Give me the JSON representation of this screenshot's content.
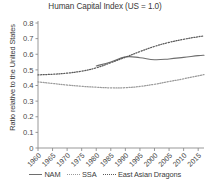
{
  "chart_data": {
    "type": "line",
    "title": "Human Capital Index (US = 1.0)",
    "xlabel": "",
    "ylabel": "Ratio relative to the United States",
    "xlim": [
      1960,
      2017
    ],
    "ylim": [
      0,
      0.8
    ],
    "grid": false,
    "legend_position": "bottom",
    "yticks": [
      "0",
      "0.1",
      "0.2",
      "0.3",
      "0.4",
      "0.5",
      "0.6",
      "0.7",
      "0.8"
    ],
    "ytick_values": [
      0,
      0.1,
      0.2,
      0.3,
      0.4,
      0.5,
      0.6,
      0.7,
      0.8
    ],
    "xticks": [
      "1960",
      "1965",
      "1970",
      "1975",
      "1980",
      "1985",
      "1990",
      "1995",
      "2000",
      "2005",
      "2010",
      "2015"
    ],
    "xtick_values": [
      1960,
      1965,
      1970,
      1975,
      1980,
      1985,
      1990,
      1995,
      2000,
      2005,
      2010,
      2015
    ],
    "series": [
      {
        "name": "NAM",
        "style": "solid",
        "color": "#6e6e6e",
        "x": [
          1980,
          1985,
          1990,
          1995,
          2000,
          2005,
          2010,
          2015,
          2017
        ],
        "values": [
          0.525,
          0.551,
          0.583,
          0.578,
          0.565,
          0.57,
          0.58,
          0.591,
          0.594
        ]
      },
      {
        "name": "SSA",
        "style": "dotted",
        "color": "#9a9a9a",
        "x": [
          1960,
          1965,
          1970,
          1975,
          1980,
          1985,
          1990,
          1995,
          2000,
          2005,
          2010,
          2015,
          2017
        ],
        "values": [
          0.423,
          0.413,
          0.403,
          0.395,
          0.389,
          0.385,
          0.386,
          0.394,
          0.408,
          0.425,
          0.443,
          0.462,
          0.47
        ]
      },
      {
        "name": "East Asian Dragons",
        "style": "dotted",
        "color": "#5a5a5a",
        "x": [
          1960,
          1965,
          1970,
          1975,
          1980,
          1985,
          1990,
          1995,
          2000,
          2005,
          2010,
          2015,
          2017
        ],
        "values": [
          0.468,
          0.472,
          0.479,
          0.492,
          0.513,
          0.546,
          0.581,
          0.617,
          0.65,
          0.676,
          0.696,
          0.712,
          0.717
        ]
      }
    ]
  },
  "legend": {
    "items": [
      {
        "label": "NAM"
      },
      {
        "label": "SSA"
      },
      {
        "label": "East Asian Dragons"
      }
    ]
  }
}
